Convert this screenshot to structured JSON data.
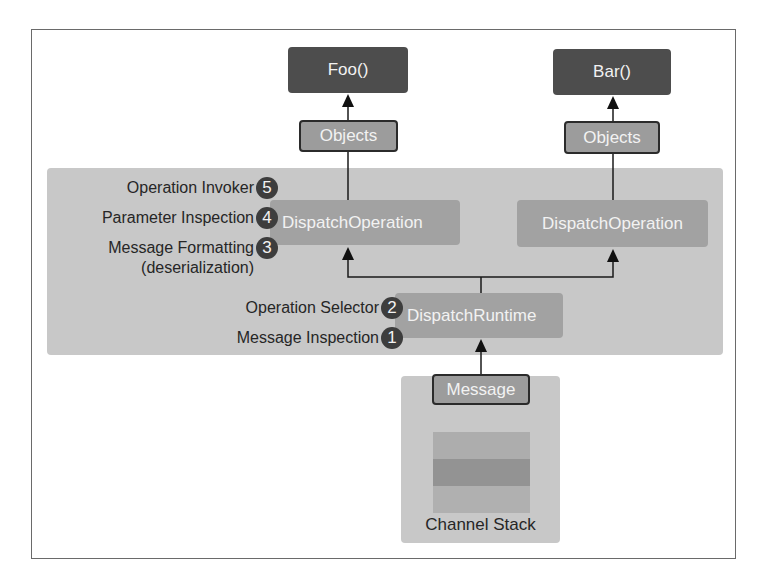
{
  "diagram": {
    "methods": [
      {
        "label": "Foo()"
      },
      {
        "label": "Bar()"
      }
    ],
    "objects": [
      {
        "label": "Objects"
      },
      {
        "label": "Objects"
      }
    ],
    "dispatch_operations": [
      {
        "label": "DispatchOperation"
      },
      {
        "label": "DispatchOperation"
      }
    ],
    "dispatch_runtime": {
      "label": "DispatchRuntime"
    },
    "message": {
      "label": "Message"
    },
    "channel_stack": {
      "label": "Channel Stack",
      "layers": 3
    },
    "steps": [
      {
        "number": "1",
        "label": "Message Inspection"
      },
      {
        "number": "2",
        "label": "Operation Selector"
      },
      {
        "number": "3",
        "label": "Message Formatting",
        "sublabel": "(deserialization)"
      },
      {
        "number": "4",
        "label": "Parameter Inspection"
      },
      {
        "number": "5",
        "label": "Operation Invoker"
      }
    ],
    "colors": {
      "dark_box": "#4d4d4d",
      "panel": "#c8c8c8",
      "operation_box": "#a2a2a2",
      "badge": "#3d3d3d"
    }
  }
}
